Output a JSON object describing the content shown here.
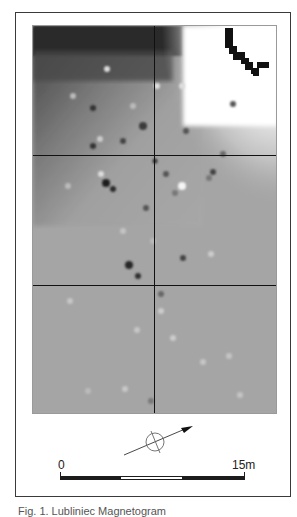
{
  "figure": {
    "type": "geophysical survey grayscale plot",
    "grid": {
      "columns": 2,
      "rows": 3,
      "line_color": "#111111"
    },
    "colors": {
      "background_plot": "#a6a6a6",
      "dark_anomaly": "#1a1a1a",
      "light_area": "#ffffff",
      "frame": "#3a3a3a"
    }
  },
  "north_arrow": {
    "icon": "north-arrow-icon",
    "direction_deg": 68
  },
  "scale_bar": {
    "start_label": "0",
    "end_label": "15m",
    "segments": [
      "dark",
      "light",
      "dark"
    ]
  },
  "caption": {
    "text": "Fig. 1. Lubliniec Magnetogram"
  }
}
